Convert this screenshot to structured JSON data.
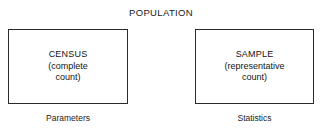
{
  "diagram": {
    "title": "POPULATION",
    "nodes": [
      {
        "heading": "CENSUS",
        "line2": "(complete",
        "line3": "count)",
        "caption": "Parameters"
      },
      {
        "heading": "SAMPLE",
        "line2": "(representative",
        "line3": "count)",
        "caption": "Statistics"
      }
    ],
    "colors": {
      "background": "#ffffff",
      "border": "#2b2b2b",
      "text": "#131313"
    }
  }
}
